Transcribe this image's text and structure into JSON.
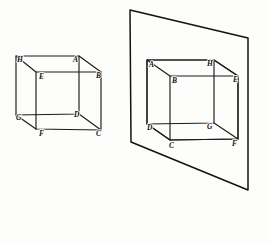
{
  "figure": {
    "stroke_color": "#1a1a1a",
    "background_color": "#fdfdfb",
    "left_cube": {
      "name": "left-cube",
      "caption": "",
      "vertices": [
        {
          "key": "H",
          "label": "H",
          "x": 17,
          "y": 62,
          "anchor": "start"
        },
        {
          "key": "A",
          "label": "A",
          "x": 73,
          "y": 62,
          "anchor": "start"
        },
        {
          "key": "B",
          "label": "B",
          "x": 96,
          "y": 77,
          "anchor": "start"
        },
        {
          "key": "E",
          "label": "E",
          "x": 38,
          "y": 77,
          "anchor": "start"
        },
        {
          "key": "G",
          "label": "G",
          "x": 16,
          "y": 119,
          "anchor": "start"
        },
        {
          "key": "D",
          "label": "D",
          "x": 74,
          "y": 116,
          "anchor": "start"
        },
        {
          "key": "C",
          "label": "C",
          "x": 96,
          "y": 131,
          "anchor": "start"
        },
        {
          "key": "F",
          "label": "F",
          "x": 39,
          "y": 133,
          "anchor": "start"
        }
      ],
      "points": {
        "H": [
          16,
          56
        ],
        "A": [
          79,
          56
        ],
        "B": [
          101,
          72
        ],
        "E": [
          36,
          72
        ],
        "G": [
          16,
          115
        ],
        "D": [
          79,
          114
        ],
        "C": [
          101,
          130
        ],
        "F": [
          36,
          129
        ]
      }
    },
    "right_cube": {
      "name": "right-cube",
      "caption": "",
      "vertices": [
        {
          "key": "A",
          "label": "A",
          "x": 149,
          "y": 66,
          "anchor": "start"
        },
        {
          "key": "H",
          "label": "H",
          "x": 208,
          "y": 63,
          "anchor": "start"
        },
        {
          "key": "E",
          "label": "E",
          "x": 235,
          "y": 80,
          "anchor": "start"
        },
        {
          "key": "B",
          "label": "B",
          "x": 171,
          "y": 81,
          "anchor": "start"
        },
        {
          "key": "D",
          "label": "D",
          "x": 147,
          "y": 128,
          "anchor": "start"
        },
        {
          "key": "G",
          "label": "G",
          "x": 208,
          "y": 126,
          "anchor": "start"
        },
        {
          "key": "F",
          "label": "F",
          "x": 233,
          "y": 142,
          "anchor": "start"
        },
        {
          "key": "C",
          "label": "C",
          "x": 171,
          "y": 145,
          "anchor": "start"
        }
      ],
      "points": {
        "A": [
          147,
          60
        ],
        "H": [
          214,
          60
        ],
        "E": [
          238,
          76
        ],
        "B": [
          170,
          76
        ],
        "D": [
          147,
          124
        ],
        "G": [
          214,
          123
        ],
        "F": [
          238,
          139
        ],
        "C": [
          170,
          140
        ]
      }
    },
    "plane": {
      "name": "projection-plane",
      "corners": [
        [
          130,
          10
        ],
        [
          248,
          38
        ],
        [
          248,
          190
        ],
        [
          131,
          142
        ]
      ]
    }
  }
}
